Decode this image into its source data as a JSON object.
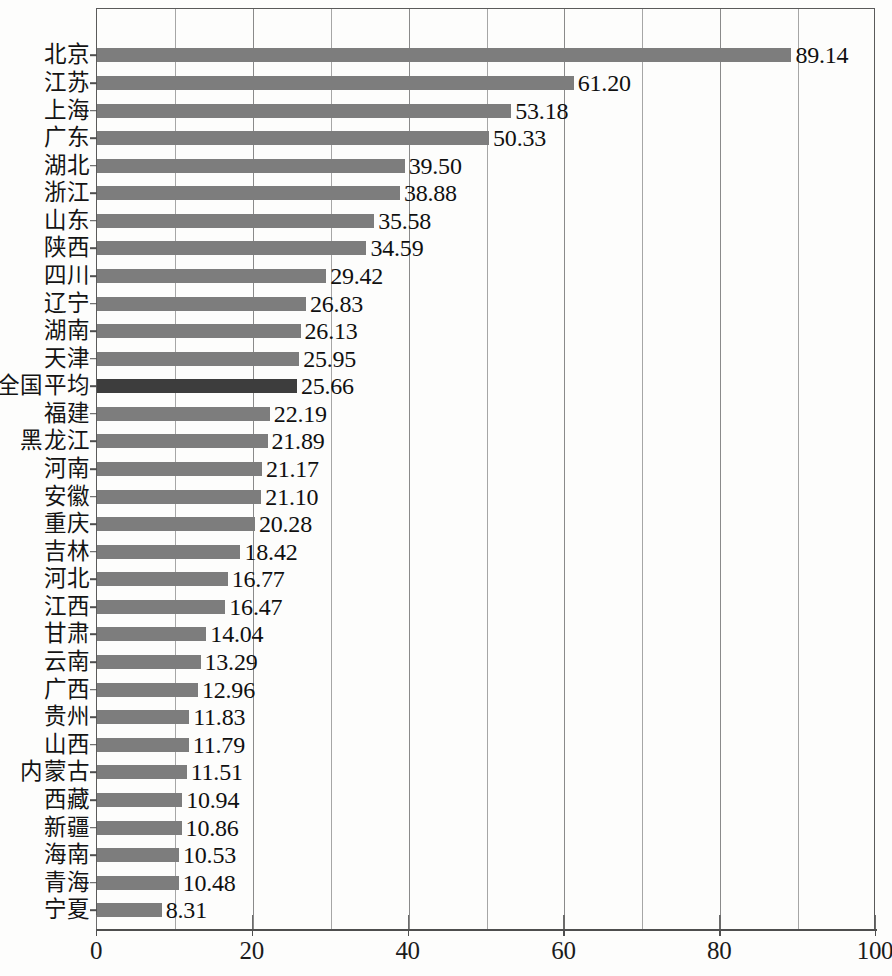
{
  "chart_data": {
    "type": "bar",
    "orientation": "horizontal",
    "title": "",
    "subtitle": "",
    "xlabel": "",
    "ylabel": "",
    "xlim": [
      0,
      100
    ],
    "grid": true,
    "grid_axis": "x",
    "legend": null,
    "major_tick_step": 20,
    "minor_tick_step": 10,
    "x_tick_labels": [
      "0",
      "20",
      "40",
      "60",
      "80",
      "100"
    ],
    "x_tick_values": [
      0,
      20,
      40,
      60,
      80,
      100
    ],
    "minor_gridline_values": [
      10,
      20,
      30,
      40,
      50,
      60,
      70,
      80,
      90
    ],
    "bar_color": "#7d7d7d",
    "highlight_color": "#3d3d3d",
    "highlight_category": "全国平均",
    "value_format": "0.00",
    "categories": [
      "北京",
      "江苏",
      "上海",
      "广东",
      "湖北",
      "浙江",
      "山东",
      "陕西",
      "四川",
      "辽宁",
      "湖南",
      "天津",
      "全国平均",
      "福建",
      "黑龙江",
      "河南",
      "安徽",
      "重庆",
      "吉林",
      "河北",
      "江西",
      "甘肃",
      "云南",
      "广西",
      "贵州",
      "山西",
      "内蒙古",
      "西藏",
      "新疆",
      "海南",
      "青海",
      "宁夏"
    ],
    "values": [
      89.14,
      61.2,
      53.18,
      50.33,
      39.5,
      38.88,
      35.58,
      34.59,
      29.42,
      26.83,
      26.13,
      25.95,
      25.66,
      22.19,
      21.89,
      21.17,
      21.1,
      20.28,
      18.42,
      16.77,
      16.47,
      14.04,
      13.29,
      12.96,
      11.83,
      11.79,
      11.51,
      10.94,
      10.86,
      10.53,
      10.48,
      8.31
    ],
    "value_labels": [
      "89.14",
      "61.20",
      "53.18",
      "50.33",
      "39.50",
      "38.88",
      "35.58",
      "34.59",
      "29.42",
      "26.83",
      "26.13",
      "25.95",
      "25.66",
      "22.19",
      "21.89",
      "21.17",
      "21.10",
      "20.28",
      "18.42",
      "16.77",
      "16.47",
      "14.04",
      "13.29",
      "12.96",
      "11.83",
      "11.79",
      "11.51",
      "10.94",
      "10.86",
      "10.53",
      "10.48",
      "8.31"
    ]
  }
}
